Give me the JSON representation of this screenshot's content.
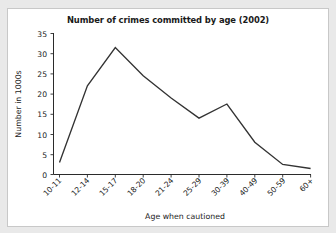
{
  "figure": {
    "background_color": "#ffffff",
    "page_color": "#e9e9e9",
    "border_color": "#c8c8c8",
    "line_color": "#333333"
  },
  "chart_data": {
    "type": "line",
    "title": "Number of crimes committed by age (2002)",
    "xlabel": "Age when cautioned",
    "ylabel": "Number in 1000s",
    "categories": [
      "10-11",
      "12-14",
      "15-17",
      "18-20",
      "21-24",
      "25-29",
      "30-39",
      "40-49",
      "50-59",
      "60+"
    ],
    "values": [
      3,
      22,
      31.5,
      24.5,
      19,
      14,
      17.5,
      8,
      2.5,
      1.5
    ],
    "series": [
      {
        "name": "Number of crimes",
        "values": [
          3,
          22,
          31.5,
          24.5,
          19,
          14,
          17.5,
          8,
          2.5,
          1.5
        ]
      }
    ],
    "ylim": [
      0,
      35
    ],
    "yticks": [
      0,
      5,
      10,
      15,
      20,
      25,
      30,
      35
    ],
    "ytick_labels": [
      "0",
      "5",
      "10",
      "15",
      "20",
      "25",
      "30",
      "35"
    ],
    "grid": false,
    "legend": false,
    "legend_position": "none"
  }
}
